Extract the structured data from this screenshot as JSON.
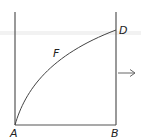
{
  "diagram": {
    "labels": {
      "A": "A",
      "B": "B",
      "D": "D",
      "F": "F"
    },
    "colors": {
      "line": "#555555",
      "text": "#222222",
      "band": "#f0f0f0"
    },
    "elements": [
      {
        "type": "vertical-wall",
        "name": "left-wall",
        "from": "top",
        "to": "A"
      },
      {
        "type": "vertical-wall",
        "name": "right-wall",
        "from": "top",
        "to": "B",
        "through": "D"
      },
      {
        "type": "segment",
        "name": "base",
        "from": "A",
        "to": "B"
      },
      {
        "type": "curve",
        "name": "curve-AFD",
        "from": "A",
        "via": "F",
        "to": "D"
      },
      {
        "type": "arrow",
        "name": "right-arrow",
        "direction": "right"
      }
    ]
  }
}
